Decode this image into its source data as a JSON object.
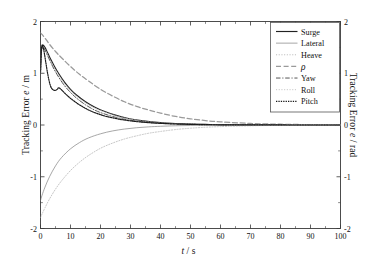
{
  "chart_data": {
    "type": "line",
    "title": "",
    "xlabel": "t / s",
    "ylabel": "Tracking Error e / m",
    "ylabel_right": "Tracking Error e / rad",
    "xlim": [
      0,
      100
    ],
    "ylim": [
      -2,
      2
    ],
    "ylim_right": [
      -2,
      2
    ],
    "grid": false,
    "legend_position": "top-right-inside",
    "xticks": [
      0,
      10,
      20,
      30,
      40,
      50,
      60,
      70,
      80,
      90,
      100
    ],
    "xtick_labels": [
      "0",
      "10",
      "20",
      "30",
      "40",
      "50",
      "60",
      "70",
      "80",
      "90",
      "100"
    ],
    "yticks": [
      -2,
      -1,
      0,
      1,
      2
    ],
    "ytick_labels": [
      "-2",
      "-1",
      "0",
      "1",
      "2"
    ],
    "yticks_right": [
      -2,
      -1,
      0,
      1,
      2
    ],
    "ytick_labels_right": [
      "-2",
      "-1",
      "0",
      "1",
      "2"
    ],
    "series": [
      {
        "name": "Surge",
        "style": "solid",
        "color": "#222222",
        "width": 1.15,
        "axis": "left",
        "x": [
          0,
          0.3,
          0.8,
          1.5,
          2.5,
          3.5,
          4.5,
          6,
          8,
          10,
          12,
          15,
          18,
          21,
          25,
          29,
          33,
          37,
          41,
          45,
          50,
          55,
          60,
          70,
          80,
          90,
          100
        ],
        "y": [
          1.05,
          1.45,
          1.54,
          1.5,
          1.38,
          1.26,
          1.15,
          1.0,
          0.83,
          0.69,
          0.58,
          0.45,
          0.35,
          0.27,
          0.19,
          0.13,
          0.09,
          0.06,
          0.04,
          0.03,
          0.018,
          0.011,
          0.007,
          0.003,
          0.001,
          0.0005,
          0.0
        ]
      },
      {
        "name": "Lateral",
        "style": "solid-thin",
        "color": "#8a8a8a",
        "width": 0.75,
        "axis": "left",
        "x": [
          0,
          0.5,
          1.5,
          3,
          5,
          7,
          10,
          13,
          16,
          20,
          24,
          28,
          32,
          36,
          40,
          45,
          50,
          55,
          60,
          70,
          80,
          90,
          100
        ],
        "y": [
          -1.46,
          -1.36,
          -1.2,
          -1.0,
          -0.79,
          -0.63,
          -0.46,
          -0.34,
          -0.25,
          -0.17,
          -0.115,
          -0.078,
          -0.053,
          -0.036,
          -0.025,
          -0.015,
          -0.009,
          -0.006,
          -0.0035,
          -0.0015,
          -0.0006,
          -0.0002,
          0.0
        ]
      },
      {
        "name": "Heave",
        "style": "dotted-light",
        "color": "#b5b5b5",
        "width": 0.8,
        "axis": "left",
        "x": [
          0,
          0.3,
          0.8,
          1.5,
          2.5,
          3.5,
          4.5,
          6,
          8,
          10,
          12,
          15,
          18,
          21,
          25,
          29,
          33,
          37,
          41,
          45,
          50,
          55,
          60,
          70,
          80,
          90,
          100
        ],
        "y": [
          1.02,
          1.42,
          1.5,
          1.46,
          1.34,
          1.22,
          1.11,
          0.97,
          0.8,
          0.67,
          0.56,
          0.43,
          0.33,
          0.26,
          0.18,
          0.125,
          0.085,
          0.057,
          0.038,
          0.027,
          0.016,
          0.01,
          0.006,
          0.0025,
          0.001,
          0.0004,
          0.0
        ]
      },
      {
        "name": "rho",
        "label": "ρ",
        "style": "dashed",
        "color": "#9a9a9a",
        "width": 1.25,
        "axis": "right",
        "x": [
          0,
          0.5,
          1.5,
          3,
          5,
          7,
          10,
          13,
          16,
          20,
          24,
          28,
          32,
          36,
          40,
          45,
          50,
          55,
          60,
          70,
          80,
          90,
          100
        ],
        "y": [
          1.78,
          1.75,
          1.68,
          1.56,
          1.42,
          1.3,
          1.13,
          0.98,
          0.85,
          0.69,
          0.56,
          0.45,
          0.36,
          0.29,
          0.23,
          0.165,
          0.12,
          0.085,
          0.06,
          0.03,
          0.015,
          0.007,
          0.003
        ]
      },
      {
        "name": "Yaw",
        "style": "dashdot",
        "color": "#555555",
        "width": 1.0,
        "axis": "right",
        "x": [
          0,
          0.3,
          0.8,
          1.5,
          2.5,
          3.5,
          4.5,
          6,
          8,
          10,
          12,
          15,
          18,
          21,
          25,
          29,
          33,
          37,
          41,
          45,
          50,
          55,
          60,
          70,
          80,
          90,
          100
        ],
        "y": [
          1.0,
          1.4,
          1.5,
          1.45,
          1.32,
          1.2,
          1.08,
          0.93,
          0.76,
          0.63,
          0.52,
          0.39,
          0.29,
          0.22,
          0.15,
          0.1,
          0.067,
          0.045,
          0.03,
          0.021,
          0.012,
          0.007,
          0.004,
          0.0015,
          0.0006,
          0.0002,
          0.0
        ]
      },
      {
        "name": "Roll",
        "style": "dotted-light",
        "color": "#c0c0c0",
        "width": 0.9,
        "axis": "right",
        "x": [
          0,
          0.5,
          1.5,
          3,
          5,
          7,
          10,
          13,
          16,
          20,
          24,
          28,
          32,
          36,
          40,
          45,
          50,
          55,
          60,
          70,
          80,
          90,
          100
        ],
        "y": [
          -1.79,
          -1.72,
          -1.6,
          -1.43,
          -1.24,
          -1.08,
          -0.88,
          -0.72,
          -0.59,
          -0.45,
          -0.35,
          -0.27,
          -0.21,
          -0.16,
          -0.125,
          -0.088,
          -0.062,
          -0.044,
          -0.031,
          -0.015,
          -0.008,
          -0.004,
          -0.002
        ]
      },
      {
        "name": "Pitch",
        "style": "dotted-dense",
        "color": "#1a1a1a",
        "width": 1.2,
        "axis": "right",
        "x": [
          0,
          0.2,
          0.5,
          0.9,
          1.3,
          1.8,
          2.3,
          2.8,
          3.2,
          3.6,
          4.2,
          5.0,
          5.6,
          6.0,
          6.4,
          7.0,
          8.0,
          9.5,
          11,
          13,
          16,
          19,
          22,
          26,
          30,
          34,
          38,
          42,
          46,
          50,
          55,
          60,
          70,
          80,
          90,
          100
        ],
        "y": [
          1.02,
          1.35,
          1.54,
          1.5,
          1.38,
          1.2,
          1.02,
          0.87,
          0.78,
          0.72,
          0.68,
          0.67,
          0.69,
          0.72,
          0.71,
          0.68,
          0.62,
          0.54,
          0.47,
          0.39,
          0.29,
          0.22,
          0.165,
          0.115,
          0.08,
          0.055,
          0.038,
          0.026,
          0.018,
          0.012,
          0.007,
          0.004,
          0.0015,
          0.0006,
          0.0002,
          0.0
        ]
      }
    ],
    "legend_entries": [
      {
        "label": "Surge",
        "style": "solid",
        "color": "#222222"
      },
      {
        "label": "Lateral",
        "style": "solid-thin",
        "color": "#8a8a8a"
      },
      {
        "label": "Heave",
        "style": "dotted-light",
        "color": "#b5b5b5"
      },
      {
        "label": "ρ",
        "style": "dashed",
        "color": "#9a9a9a",
        "italic": true
      },
      {
        "label": "Yaw",
        "style": "dashdot",
        "color": "#555555"
      },
      {
        "label": "Roll",
        "style": "dotted-light",
        "color": "#c0c0c0"
      },
      {
        "label": "Pitch",
        "style": "dotted-dense",
        "color": "#1a1a1a"
      }
    ]
  },
  "axes": {
    "xlabel_var": "t",
    "xlabel_unit": "/ s",
    "ylabel_left_pre": "Tracking Error ",
    "ylabel_left_var": "e",
    "ylabel_left_unit": " / m",
    "ylabel_right_pre": "Tracking Error ",
    "ylabel_right_var": "e",
    "ylabel_right_unit": " / rad"
  },
  "colors": {
    "frame": "#3a3a3a",
    "background": "#ffffff",
    "legend_border": "#555555",
    "text": "#111111"
  }
}
